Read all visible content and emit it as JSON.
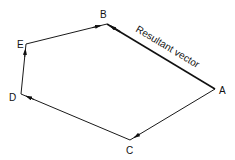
{
  "diagram": {
    "type": "vector polygon",
    "vertices": {
      "A": {
        "label": "A",
        "x": 215,
        "y": 89,
        "lx": 219,
        "ly": 93
      },
      "B": {
        "label": "B",
        "x": 107,
        "y": 24,
        "lx": 100,
        "ly": 18
      },
      "C": {
        "label": "C",
        "x": 130,
        "y": 140,
        "lx": 126,
        "ly": 153
      },
      "D": {
        "label": "D",
        "x": 21,
        "y": 94,
        "lx": 9,
        "ly": 100
      },
      "E": {
        "label": "E",
        "x": 26,
        "y": 44,
        "lx": 17,
        "ly": 48
      }
    },
    "edges": [
      {
        "from": "A",
        "to": "C"
      },
      {
        "from": "C",
        "to": "D"
      },
      {
        "from": "D",
        "to": "E"
      },
      {
        "from": "E",
        "to": "B"
      }
    ],
    "resultant": {
      "from": "A",
      "to": "B",
      "label": "Resultant vector"
    },
    "labels": {
      "A": "A",
      "B": "B",
      "C": "C",
      "D": "D",
      "E": "E",
      "resultant": "Resultant vector"
    }
  }
}
